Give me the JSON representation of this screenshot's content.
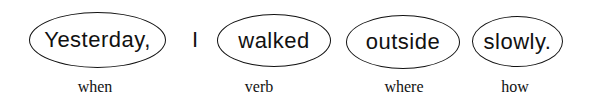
{
  "sentence": {
    "words": [
      {
        "text": "Yesterday,",
        "circled": true,
        "label": "when"
      },
      {
        "text": "I",
        "circled": false,
        "label": ""
      },
      {
        "text": "walked",
        "circled": true,
        "label": "verb"
      },
      {
        "text": "outside",
        "circled": true,
        "label": "where"
      },
      {
        "text": "slowly.",
        "circled": true,
        "label": "how"
      }
    ]
  }
}
